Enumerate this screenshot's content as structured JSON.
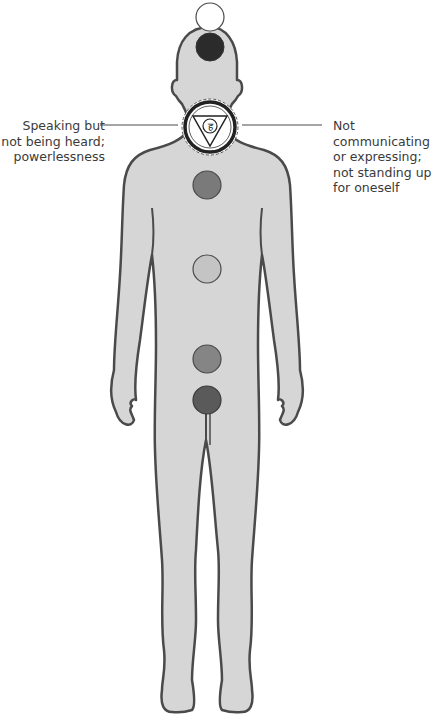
{
  "diagram": {
    "colors": {
      "background": "#ffffff",
      "body_fill": "#d6d6d6",
      "body_outline": "#4a4a4a",
      "text": "#3a3a3a"
    },
    "annotations": {
      "left": "Speaking but\nnot being heard;\npowerlessness",
      "right": "Not communicating\nor expressing;\nnot standing up\nfor oneself"
    },
    "chakras": [
      {
        "name": "crown",
        "cx": 210,
        "cy": 17,
        "r": 14,
        "fill": "#ffffff"
      },
      {
        "name": "third-eye",
        "cx": 210,
        "cy": 47,
        "r": 14,
        "fill": "#2b2b2b"
      },
      {
        "name": "throat",
        "cx": 210,
        "cy": 127,
        "r": 26,
        "fill": "#ffffff",
        "highlighted": true,
        "symbol": "हं"
      },
      {
        "name": "heart",
        "cx": 207,
        "cy": 185,
        "r": 14,
        "fill": "#7a7a7a"
      },
      {
        "name": "solar-plexus",
        "cx": 207,
        "cy": 269,
        "r": 14,
        "fill": "#c4c4c4"
      },
      {
        "name": "sacral",
        "cx": 207,
        "cy": 359,
        "r": 14,
        "fill": "#858585"
      },
      {
        "name": "root",
        "cx": 207,
        "cy": 400,
        "r": 14,
        "fill": "#5a5a5a"
      }
    ]
  }
}
